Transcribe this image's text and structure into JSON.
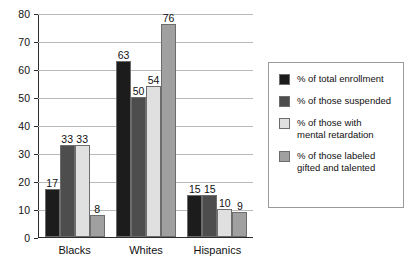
{
  "chart_data": {
    "type": "bar",
    "title": "",
    "subtitle": "",
    "xlabel": "",
    "ylabel": "",
    "ylim": [
      0,
      80
    ],
    "ytick_step": 10,
    "yticks": [
      80,
      70,
      60,
      50,
      40,
      30,
      20,
      10,
      0
    ],
    "grid": true,
    "grid_axis": "y",
    "legend_position": "right",
    "categories": [
      "Blacks",
      "Whites",
      "Hispanics"
    ],
    "series": [
      {
        "name": "% of total enrollment",
        "color": "#1c1c1c",
        "values": [
          17,
          63,
          15
        ]
      },
      {
        "name": "% of those suspended",
        "color": "#4d4d4d",
        "values": [
          33,
          50,
          15
        ]
      },
      {
        "name": "% of those with mental retardation",
        "color": "#e0e0e0",
        "values": [
          33,
          54,
          10
        ]
      },
      {
        "name": "% of those labeled gifted and talented",
        "color": "#a0a0a0",
        "values": [
          8,
          76,
          9
        ]
      }
    ]
  },
  "legend": {
    "items": [
      {
        "label_line1": "% of total enrollment",
        "label_line2": "",
        "color": "#1c1c1c"
      },
      {
        "label_line1": "% of those suspended",
        "label_line2": "",
        "color": "#4d4d4d"
      },
      {
        "label_line1": "% of those with",
        "label_line2": "mental retardation",
        "color": "#e0e0e0"
      },
      {
        "label_line1": "% of those labeled",
        "label_line2": "gifted and talented",
        "color": "#a0a0a0"
      }
    ]
  },
  "axis": {
    "y_tick_labels": [
      "80",
      "70",
      "60",
      "50",
      "40",
      "30",
      "20",
      "10",
      "0"
    ],
    "x_tick_labels": [
      "Blacks",
      "Whites",
      "Hispanics"
    ]
  }
}
